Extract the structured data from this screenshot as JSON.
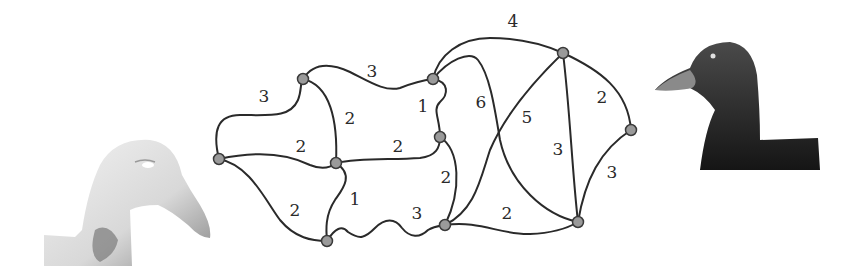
{
  "figure": {
    "left_image": {
      "name": "light-duck",
      "tone": "#e4e4e4"
    },
    "right_image": {
      "name": "dark-duck",
      "tone": "#2b2b2b"
    }
  },
  "graph": {
    "nodes": [
      {
        "id": "A",
        "x": 219,
        "y": 159
      },
      {
        "id": "B",
        "x": 303,
        "y": 79
      },
      {
        "id": "C",
        "x": 336,
        "y": 163
      },
      {
        "id": "D",
        "x": 327,
        "y": 241
      },
      {
        "id": "E",
        "x": 433,
        "y": 79
      },
      {
        "id": "F",
        "x": 440,
        "y": 137
      },
      {
        "id": "G",
        "x": 445,
        "y": 225
      },
      {
        "id": "H",
        "x": 563,
        "y": 53
      },
      {
        "id": "I",
        "x": 631,
        "y": 130
      },
      {
        "id": "J",
        "x": 578,
        "y": 222
      }
    ],
    "edges": [
      {
        "from": "A",
        "to": "B",
        "weight": "3",
        "label_x": 264,
        "label_y": 97
      },
      {
        "from": "B",
        "to": "E",
        "weight": "3",
        "label_x": 372,
        "label_y": 72
      },
      {
        "from": "B",
        "to": "C",
        "weight": "2",
        "label_x": 350,
        "label_y": 119
      },
      {
        "from": "A",
        "to": "C",
        "weight": "2",
        "label_x": 301,
        "label_y": 147
      },
      {
        "from": "C",
        "to": "F",
        "weight": "2",
        "label_x": 398,
        "label_y": 147
      },
      {
        "from": "E",
        "to": "F",
        "weight": "1",
        "label_x": 423,
        "label_y": 107
      },
      {
        "from": "A",
        "to": "D",
        "weight": "2",
        "label_x": 295,
        "label_y": 211
      },
      {
        "from": "C",
        "to": "D",
        "weight": "1",
        "label_x": 355,
        "label_y": 200
      },
      {
        "from": "D",
        "to": "G",
        "weight": "3",
        "label_x": 417,
        "label_y": 214
      },
      {
        "from": "F",
        "to": "G",
        "weight": "2",
        "label_x": 446,
        "label_y": 178
      },
      {
        "from": "E",
        "to": "H",
        "weight": "4",
        "label_x": 513,
        "label_y": 22
      },
      {
        "from": "E",
        "to": "J",
        "weight": "6",
        "label_x": 481,
        "label_y": 103
      },
      {
        "from": "G",
        "to": "H",
        "weight": "5",
        "label_x": 527,
        "label_y": 118
      },
      {
        "from": "H",
        "to": "J",
        "weight": "3",
        "label_x": 558,
        "label_y": 150
      },
      {
        "from": "H",
        "to": "I",
        "weight": "2",
        "label_x": 602,
        "label_y": 98
      },
      {
        "from": "I",
        "to": "J",
        "weight": "3",
        "label_x": 612,
        "label_y": 173
      },
      {
        "from": "G",
        "to": "J",
        "weight": "2",
        "label_x": 507,
        "label_y": 214
      }
    ]
  }
}
